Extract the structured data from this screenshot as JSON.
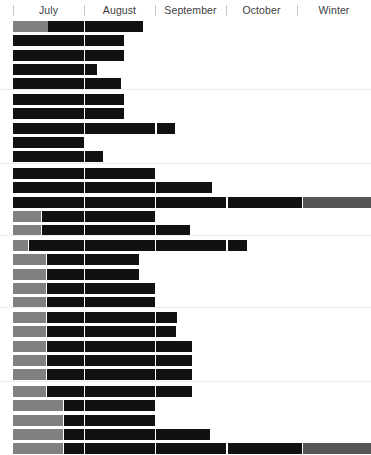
{
  "chart_data": {
    "type": "bar",
    "orientation": "horizontal",
    "title": "",
    "xlabel": "",
    "ylabel": "",
    "grid": false,
    "legend_position": "none",
    "axis": {
      "categories": [
        "July",
        "August",
        "September",
        "October",
        "Winter"
      ],
      "tick_positions_px": [
        13,
        84,
        155,
        226,
        297,
        371
      ],
      "x_start_px": 13,
      "x_end_px": 371,
      "segment_boundaries_px": [
        13,
        84,
        155,
        226,
        303,
        371
      ]
    },
    "colors": {
      "dark": "#111111",
      "gray": "#808080",
      "gray_mid": "#6e6e6e",
      "gray_dark": "#555555",
      "background": "#ffffff",
      "rule": "#ededed",
      "tick": "#c9c9c9",
      "label_text": "#3d3d3d"
    },
    "groups": [
      {
        "index": 1,
        "rows": [
          {
            "segments": [
              {
                "color": "gray",
                "start": 13,
                "end": 48
              },
              {
                "color": "dark",
                "start": 48,
                "end": 84
              },
              {
                "color": "dark",
                "start": 85,
                "end": 143
              }
            ]
          },
          {
            "segments": [
              {
                "color": "dark",
                "start": 13,
                "end": 84
              },
              {
                "color": "dark",
                "start": 85,
                "end": 124
              }
            ]
          },
          {
            "segments": [
              {
                "color": "dark",
                "start": 13,
                "end": 84
              },
              {
                "color": "dark",
                "start": 85,
                "end": 124
              }
            ]
          },
          {
            "segments": [
              {
                "color": "dark",
                "start": 13,
                "end": 84
              },
              {
                "color": "dark",
                "start": 85,
                "end": 97
              }
            ]
          },
          {
            "segments": [
              {
                "color": "dark",
                "start": 13,
                "end": 84
              },
              {
                "color": "dark",
                "start": 85,
                "end": 121
              }
            ]
          }
        ]
      },
      {
        "index": 2,
        "rows": [
          {
            "segments": [
              {
                "color": "dark",
                "start": 13,
                "end": 84
              },
              {
                "color": "dark",
                "start": 85,
                "end": 124
              }
            ]
          },
          {
            "segments": [
              {
                "color": "dark",
                "start": 13,
                "end": 84
              },
              {
                "color": "dark",
                "start": 85,
                "end": 124
              }
            ]
          },
          {
            "segments": [
              {
                "color": "dark",
                "start": 13,
                "end": 84
              },
              {
                "color": "dark",
                "start": 85,
                "end": 155
              },
              {
                "color": "dark",
                "start": 157,
                "end": 175
              }
            ]
          },
          {
            "segments": [
              {
                "color": "dark",
                "start": 13,
                "end": 84
              }
            ]
          },
          {
            "segments": [
              {
                "color": "dark",
                "start": 13,
                "end": 84
              },
              {
                "color": "dark",
                "start": 85,
                "end": 103
              }
            ]
          }
        ]
      },
      {
        "index": 3,
        "rows": [
          {
            "segments": [
              {
                "color": "dark",
                "start": 13,
                "end": 84
              },
              {
                "color": "dark",
                "start": 85,
                "end": 155
              }
            ]
          },
          {
            "segments": [
              {
                "color": "dark",
                "start": 13,
                "end": 84
              },
              {
                "color": "dark",
                "start": 85,
                "end": 155
              },
              {
                "color": "dark",
                "start": 156,
                "end": 212
              }
            ]
          },
          {
            "segments": [
              {
                "color": "dark",
                "start": 13,
                "end": 84
              },
              {
                "color": "dark",
                "start": 85,
                "end": 155
              },
              {
                "color": "dark",
                "start": 156,
                "end": 226
              },
              {
                "color": "dark",
                "start": 228,
                "end": 302
              },
              {
                "color": "gray_dark",
                "start": 303,
                "end": 371
              }
            ]
          },
          {
            "segments": [
              {
                "color": "gray",
                "start": 13,
                "end": 41
              },
              {
                "color": "dark",
                "start": 42,
                "end": 84
              },
              {
                "color": "dark",
                "start": 85,
                "end": 155
              }
            ]
          },
          {
            "segments": [
              {
                "color": "gray",
                "start": 13,
                "end": 41
              },
              {
                "color": "dark",
                "start": 42,
                "end": 84
              },
              {
                "color": "dark",
                "start": 85,
                "end": 155
              },
              {
                "color": "dark",
                "start": 156,
                "end": 190
              }
            ]
          }
        ]
      },
      {
        "index": 4,
        "rows": [
          {
            "segments": [
              {
                "color": "gray",
                "start": 13,
                "end": 28
              },
              {
                "color": "dark",
                "start": 29,
                "end": 84
              },
              {
                "color": "dark",
                "start": 85,
                "end": 155
              },
              {
                "color": "dark",
                "start": 156,
                "end": 226
              },
              {
                "color": "dark",
                "start": 228,
                "end": 247
              }
            ]
          },
          {
            "segments": [
              {
                "color": "gray",
                "start": 13,
                "end": 46
              },
              {
                "color": "dark",
                "start": 47,
                "end": 84
              },
              {
                "color": "dark",
                "start": 85,
                "end": 139
              }
            ]
          },
          {
            "segments": [
              {
                "color": "gray",
                "start": 13,
                "end": 46
              },
              {
                "color": "dark",
                "start": 47,
                "end": 84
              },
              {
                "color": "dark",
                "start": 85,
                "end": 139
              }
            ]
          },
          {
            "segments": [
              {
                "color": "gray",
                "start": 13,
                "end": 46
              },
              {
                "color": "dark",
                "start": 47,
                "end": 84
              },
              {
                "color": "dark",
                "start": 85,
                "end": 155
              }
            ]
          },
          {
            "segments": [
              {
                "color": "gray",
                "start": 13,
                "end": 46
              },
              {
                "color": "dark",
                "start": 47,
                "end": 84
              },
              {
                "color": "dark",
                "start": 85,
                "end": 155
              }
            ]
          }
        ]
      },
      {
        "index": 5,
        "rows": [
          {
            "segments": [
              {
                "color": "gray",
                "start": 13,
                "end": 46
              },
              {
                "color": "dark",
                "start": 47,
                "end": 84
              },
              {
                "color": "dark",
                "start": 85,
                "end": 155
              },
              {
                "color": "dark",
                "start": 156,
                "end": 177
              }
            ]
          },
          {
            "segments": [
              {
                "color": "gray",
                "start": 13,
                "end": 46
              },
              {
                "color": "dark",
                "start": 47,
                "end": 84
              },
              {
                "color": "dark",
                "start": 85,
                "end": 155
              },
              {
                "color": "dark",
                "start": 156,
                "end": 176
              }
            ]
          },
          {
            "segments": [
              {
                "color": "gray",
                "start": 13,
                "end": 46
              },
              {
                "color": "dark",
                "start": 47,
                "end": 84
              },
              {
                "color": "dark",
                "start": 85,
                "end": 155
              },
              {
                "color": "dark",
                "start": 156,
                "end": 192
              }
            ]
          },
          {
            "segments": [
              {
                "color": "gray",
                "start": 13,
                "end": 46
              },
              {
                "color": "dark",
                "start": 47,
                "end": 84
              },
              {
                "color": "dark",
                "start": 85,
                "end": 155
              },
              {
                "color": "dark",
                "start": 156,
                "end": 192
              }
            ]
          },
          {
            "segments": [
              {
                "color": "gray",
                "start": 13,
                "end": 46
              },
              {
                "color": "dark",
                "start": 47,
                "end": 84
              },
              {
                "color": "dark",
                "start": 85,
                "end": 155
              },
              {
                "color": "dark",
                "start": 156,
                "end": 192
              }
            ]
          }
        ]
      },
      {
        "index": 6,
        "rows": [
          {
            "segments": [
              {
                "color": "gray",
                "start": 13,
                "end": 46
              },
              {
                "color": "dark",
                "start": 47,
                "end": 84
              },
              {
                "color": "dark",
                "start": 85,
                "end": 155
              },
              {
                "color": "dark",
                "start": 156,
                "end": 192
              }
            ]
          },
          {
            "segments": [
              {
                "color": "gray",
                "start": 13,
                "end": 63
              },
              {
                "color": "dark",
                "start": 64,
                "end": 84
              },
              {
                "color": "dark",
                "start": 85,
                "end": 155
              }
            ]
          },
          {
            "segments": [
              {
                "color": "gray",
                "start": 13,
                "end": 63
              },
              {
                "color": "dark",
                "start": 64,
                "end": 84
              },
              {
                "color": "dark",
                "start": 85,
                "end": 155
              }
            ]
          },
          {
            "segments": [
              {
                "color": "gray",
                "start": 13,
                "end": 63
              },
              {
                "color": "dark",
                "start": 64,
                "end": 84
              },
              {
                "color": "dark",
                "start": 85,
                "end": 155
              },
              {
                "color": "dark",
                "start": 156,
                "end": 210
              }
            ]
          },
          {
            "segments": [
              {
                "color": "gray",
                "start": 13,
                "end": 63
              },
              {
                "color": "dark",
                "start": 64,
                "end": 84
              },
              {
                "color": "dark",
                "start": 85,
                "end": 155
              },
              {
                "color": "dark",
                "start": 156,
                "end": 226
              },
              {
                "color": "dark",
                "start": 228,
                "end": 302
              },
              {
                "color": "gray_dark",
                "start": 303,
                "end": 371
              }
            ]
          }
        ]
      }
    ],
    "layout": {
      "header_height_px": 20,
      "row_height_px": 11,
      "row_pitch_px": 14.3,
      "group_gap_px": 7,
      "group_tops_px": [
        1,
        74,
        148,
        220,
        292,
        366
      ]
    }
  }
}
